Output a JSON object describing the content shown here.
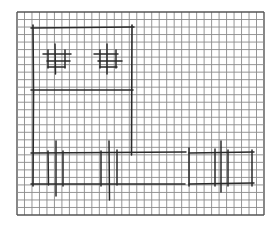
{
  "figure": {
    "type": "hand-drawn sketch on graph paper",
    "colors": {
      "background": "#ffffff",
      "grid_line": "#8a8a8a",
      "grid_border": "#555555",
      "ink": "#2a2a2a"
    },
    "grid": {
      "x0": 17,
      "y0": 12,
      "x1": 264,
      "y1": 215,
      "cols": 33,
      "rows": 27
    },
    "upper_block": {
      "left": 33,
      "right": 132,
      "top": 28,
      "bottom": 90
    },
    "windows": [
      {
        "name": "left-window",
        "cx": 58,
        "cy": 57
      },
      {
        "name": "right-window",
        "cx": 106,
        "cy": 57
      }
    ],
    "base_band": {
      "left": 33,
      "right": 252,
      "top": 152,
      "bottom": 184
    },
    "posts": [
      48,
      63,
      101,
      117,
      189,
      228
    ],
    "tall_posts": [
      56,
      109,
      222
    ]
  }
}
